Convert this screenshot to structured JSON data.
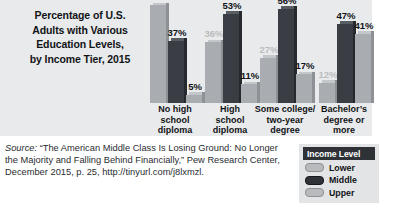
{
  "title": {
    "lines": [
      "Percentage of U.S.",
      "Adults with Various",
      "Education Levels,",
      "by Income Tier, 2015"
    ]
  },
  "legend": {
    "heading": "Income Level",
    "items": [
      {
        "label": "Lower",
        "color": "#b7bbbe"
      },
      {
        "label": "Middle",
        "color": "#2f3338"
      },
      {
        "label": "Upper",
        "color": "#b7bbbe"
      }
    ]
  },
  "source": {
    "prefix": "Source:",
    "line1": " “The American Middle Class Is Losing Ground: No",
    "line2": "Longer the Majority and Falling Behind Financially,” Pew",
    "line3": "Research Center, December 2015, p. 25,",
    "line4": "http://tinyurl.com/j8lxmzl."
  },
  "categories_wrapped": [
    [
      "No high",
      "school",
      "diploma"
    ],
    [
      "High",
      "school",
      "diploma"
    ],
    [
      "Some college/",
      "two-year",
      "degree"
    ],
    [
      "Bachelor’s",
      "degree or",
      "more"
    ]
  ],
  "chart_data": {
    "type": "bar",
    "title": "Percentage of U.S. Adults with Various Education Levels, by Income Tier, 2015",
    "xlabel": "",
    "ylabel": "",
    "ylim": [
      0,
      60
    ],
    "grid": false,
    "legend_position": "bottom-right",
    "legend_title": "Income Level",
    "categories": [
      "No high school diploma",
      "High school diploma",
      "Some college/two-year degree",
      "Bachelor’s degree or more"
    ],
    "series": [
      {
        "name": "Lower",
        "values": [
          58,
          36,
          27,
          12
        ],
        "labels": [
          "58%",
          "36%",
          "27%",
          "12%"
        ]
      },
      {
        "name": "Middle",
        "values": [
          37,
          53,
          56,
          47
        ],
        "labels": [
          "37%",
          "53%",
          "56%",
          "47%"
        ]
      },
      {
        "name": "Upper",
        "values": [
          5,
          11,
          17,
          41
        ],
        "labels": [
          "5%",
          "11%",
          "17%",
          "41%"
        ]
      }
    ],
    "annotations": [
      "Source: “The American Middle Class Is Losing Ground: No Longer the Majority and Falling Behind Financially,” Pew Research Center, December 2015, p. 25, http://tinyurl.com/j8lxmzl."
    ]
  }
}
